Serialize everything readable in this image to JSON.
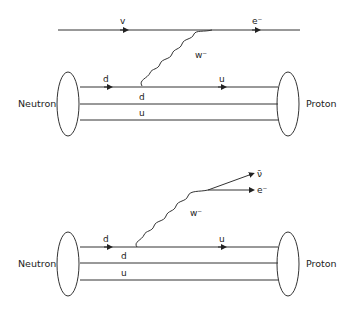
{
  "diagram1": {
    "top_line": {
      "left_label": "v",
      "right_label": "e⁻"
    },
    "boson": "w⁻",
    "left": "Neutron",
    "right": "Proton",
    "quark_top_left": "d",
    "quark_top_vertex": "d",
    "quark_top_right": "u",
    "quark_bottom": "u"
  },
  "diagram2": {
    "out1": "ν̄",
    "out2": "e⁻",
    "boson": "w⁻",
    "left": "Neutron",
    "right": "Proton",
    "quark_top_left": "d",
    "quark_mid": "d",
    "quark_top_right": "u",
    "quark_bottom": "u"
  }
}
